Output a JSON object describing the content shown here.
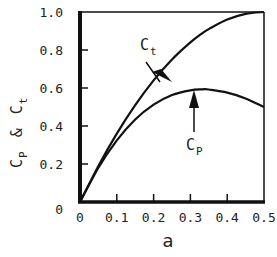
{
  "chart_data": {
    "type": "line",
    "title": "",
    "xlabel": "a",
    "ylabel": "C_P & C_t",
    "ylabel_parts": {
      "c1": "C",
      "s1": "P",
      "amp": "&",
      "c2": "C",
      "s2": "t"
    },
    "xlim": [
      0,
      0.5
    ],
    "ylim": [
      0,
      1.0
    ],
    "grid": false,
    "legend": "none (curves labeled with arrows)",
    "x_ticks": [
      "0",
      "0.1",
      "0.2",
      "0.3",
      "0.4",
      "0.5"
    ],
    "y_ticks": [
      "0",
      "0.2",
      "0.4",
      "0.6",
      "0.8",
      "1.0"
    ],
    "x": [
      0,
      0.05,
      0.1,
      0.15,
      0.2,
      0.25,
      0.3,
      0.333,
      0.35,
      0.4,
      0.45,
      0.5
    ],
    "series": [
      {
        "name": "C_t",
        "label_main": "C",
        "label_sub": "t",
        "values": [
          0,
          0.19,
          0.36,
          0.51,
          0.64,
          0.75,
          0.84,
          0.889,
          0.91,
          0.96,
          0.99,
          1.0
        ]
      },
      {
        "name": "C_P",
        "label_main": "C",
        "label_sub": "P",
        "values": [
          0,
          0.18,
          0.324,
          0.434,
          0.512,
          0.563,
          0.588,
          0.593,
          0.592,
          0.576,
          0.545,
          0.5
        ]
      }
    ],
    "annotations": [
      {
        "text": "C_t",
        "arrow_to": "C_t curve near a=0.2"
      },
      {
        "text": "C_P",
        "arrow_to": "C_P curve maximum near a=0.33"
      }
    ]
  }
}
